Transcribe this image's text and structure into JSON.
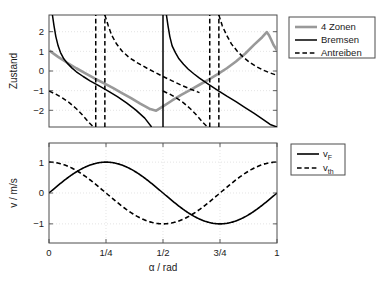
{
  "chart_data": [
    {
      "id": "top",
      "type": "line",
      "title": "",
      "xlabel": "",
      "ylabel": "Zustand",
      "xlim": [
        0,
        1
      ],
      "ylim": [
        -2.85,
        2.85
      ],
      "xticks": [],
      "xticklabels": [],
      "yticks": [
        -2,
        -1,
        0,
        1,
        2
      ],
      "yticklabels": [
        "−2",
        "−1",
        "0",
        "1",
        "2"
      ],
      "grid": true,
      "legend_position": "outside-right-top",
      "legend": [
        {
          "label": "4 Zonen",
          "style": "solid",
          "color": "#999999",
          "width": 2.6
        },
        {
          "label": "Bremsen",
          "style": "solid",
          "color": "#000000",
          "width": 1.5
        },
        {
          "label": "Antreiben",
          "style": "dashed",
          "color": "#000000",
          "width": 1.5
        }
      ],
      "series": [
        {
          "name": "4 Zonen",
          "style": "solid",
          "color": "#999999",
          "width": 2.6,
          "points": [
            [
              0.0,
              1.05
            ],
            [
              0.04,
              0.72
            ],
            [
              0.08,
              0.42
            ],
            [
              0.12,
              0.14
            ],
            [
              0.16,
              -0.12
            ],
            [
              0.2,
              -0.38
            ],
            [
              0.24,
              -0.62
            ],
            [
              0.28,
              -0.86
            ],
            [
              0.32,
              -1.12
            ],
            [
              0.36,
              -1.38
            ],
            [
              0.4,
              -1.66
            ],
            [
              0.44,
              -1.92
            ],
            [
              0.47,
              -2.02
            ],
            [
              0.5,
              -1.8
            ],
            [
              0.54,
              -1.5
            ],
            [
              0.58,
              -1.22
            ],
            [
              0.62,
              -0.96
            ],
            [
              0.66,
              -0.7
            ],
            [
              0.7,
              -0.44
            ],
            [
              0.74,
              -0.16
            ],
            [
              0.78,
              0.14
            ],
            [
              0.82,
              0.48
            ],
            [
              0.86,
              0.88
            ],
            [
              0.9,
              1.34
            ],
            [
              0.935,
              1.72
            ],
            [
              0.955,
              1.98
            ],
            [
              0.965,
              1.82
            ],
            [
              0.975,
              1.58
            ],
            [
              0.985,
              1.32
            ],
            [
              1.0,
              1.05
            ]
          ]
        },
        {
          "name": "Bremsen-a",
          "style": "solid",
          "color": "#000000",
          "width": 1.5,
          "points": [
            [
              0.015,
              2.85
            ],
            [
              0.022,
              2.3
            ],
            [
              0.03,
              1.75
            ],
            [
              0.04,
              1.28
            ],
            [
              0.05,
              0.95
            ],
            [
              0.065,
              0.62
            ],
            [
              0.08,
              0.4
            ],
            [
              0.1,
              0.16
            ],
            [
              0.12,
              -0.04
            ],
            [
              0.15,
              -0.28
            ],
            [
              0.18,
              -0.5
            ],
            [
              0.22,
              -0.76
            ],
            [
              0.26,
              -1.02
            ],
            [
              0.3,
              -1.3
            ],
            [
              0.34,
              -1.62
            ],
            [
              0.38,
              -1.98
            ],
            [
              0.42,
              -2.4
            ],
            [
              0.45,
              -2.85
            ]
          ]
        },
        {
          "name": "Bremsen-b",
          "style": "solid",
          "color": "#000000",
          "width": 1.5,
          "points": [
            [
              0.515,
              2.85
            ],
            [
              0.522,
              2.3
            ],
            [
              0.53,
              1.75
            ],
            [
              0.54,
              1.28
            ],
            [
              0.555,
              0.92
            ],
            [
              0.57,
              0.62
            ],
            [
              0.59,
              0.34
            ],
            [
              0.61,
              0.1
            ],
            [
              0.635,
              -0.14
            ],
            [
              0.66,
              -0.36
            ],
            [
              0.7,
              -0.68
            ],
            [
              0.74,
              -0.98
            ],
            [
              0.78,
              -1.28
            ],
            [
              0.82,
              -1.56
            ],
            [
              0.86,
              -1.86
            ],
            [
              0.9,
              -2.16
            ],
            [
              0.94,
              -2.48
            ],
            [
              0.97,
              -2.72
            ],
            [
              1.0,
              -2.85
            ]
          ]
        },
        {
          "name": "Bremsen-vertical",
          "style": "solid",
          "color": "#000000",
          "width": 1.5,
          "points": [
            [
              0.5,
              -2.85
            ],
            [
              0.5,
              2.85
            ]
          ]
        },
        {
          "name": "Antreiben-a",
          "style": "dashed",
          "color": "#000000",
          "width": 1.5,
          "points": [
            [
              0.0,
              -1.02
            ],
            [
              0.03,
              -1.18
            ],
            [
              0.06,
              -1.38
            ],
            [
              0.09,
              -1.62
            ],
            [
              0.12,
              -1.92
            ],
            [
              0.15,
              -2.28
            ],
            [
              0.175,
              -2.62
            ],
            [
              0.195,
              -2.85
            ]
          ]
        },
        {
          "name": "Antreiben-b",
          "style": "dashed",
          "color": "#000000",
          "width": 1.5,
          "points": [
            [
              0.245,
              2.85
            ],
            [
              0.26,
              2.3
            ],
            [
              0.275,
              1.82
            ],
            [
              0.295,
              1.4
            ],
            [
              0.32,
              1.02
            ],
            [
              0.35,
              0.7
            ],
            [
              0.39,
              0.4
            ],
            [
              0.43,
              0.14
            ],
            [
              0.47,
              -0.1
            ],
            [
              0.5,
              -0.28
            ],
            [
              0.54,
              -0.5
            ],
            [
              0.58,
              -0.72
            ],
            [
              0.62,
              -0.92
            ],
            [
              0.66,
              -1.1
            ]
          ]
        },
        {
          "name": "Antreiben-c",
          "style": "dashed",
          "color": "#000000",
          "width": 1.5,
          "points": [
            [
              0.5,
              -1.02
            ],
            [
              0.53,
              -1.18
            ],
            [
              0.56,
              -1.38
            ],
            [
              0.59,
              -1.62
            ],
            [
              0.62,
              -1.92
            ],
            [
              0.65,
              -2.28
            ],
            [
              0.675,
              -2.62
            ],
            [
              0.695,
              -2.85
            ]
          ]
        },
        {
          "name": "Antreiben-d",
          "style": "dashed",
          "color": "#000000",
          "width": 1.5,
          "points": [
            [
              0.745,
              2.85
            ],
            [
              0.76,
              2.3
            ],
            [
              0.78,
              1.8
            ],
            [
              0.8,
              1.38
            ],
            [
              0.825,
              1.02
            ],
            [
              0.85,
              0.72
            ],
            [
              0.88,
              0.44
            ],
            [
              0.91,
              0.22
            ],
            [
              0.94,
              0.04
            ],
            [
              0.97,
              -0.1
            ],
            [
              1.0,
              -0.22
            ]
          ]
        },
        {
          "name": "Antreiben-vertical-1",
          "style": "dashed",
          "color": "#000000",
          "width": 1.5,
          "points": [
            [
              0.205,
              -2.85
            ],
            [
              0.205,
              2.85
            ]
          ]
        },
        {
          "name": "Antreiben-vertical-2",
          "style": "dashed",
          "color": "#000000",
          "width": 1.5,
          "points": [
            [
              0.245,
              -2.85
            ],
            [
              0.245,
              2.85
            ]
          ]
        },
        {
          "name": "Antreiben-vertical-3",
          "style": "dashed",
          "color": "#000000",
          "width": 1.5,
          "points": [
            [
              0.705,
              -2.85
            ],
            [
              0.705,
              2.85
            ]
          ]
        },
        {
          "name": "Antreiben-vertical-4",
          "style": "dashed",
          "color": "#000000",
          "width": 1.5,
          "points": [
            [
              0.745,
              -2.85
            ],
            [
              0.745,
              2.85
            ]
          ]
        }
      ]
    },
    {
      "id": "bottom",
      "type": "line",
      "title": "",
      "xlabel": "α / rad",
      "ylabel": "v / m/s",
      "xlim": [
        0,
        1
      ],
      "ylim": [
        -1.62,
        1.62
      ],
      "xticks": [
        0,
        0.25,
        0.5,
        0.75,
        1
      ],
      "xticklabels": [
        "0",
        "1/4",
        "1/2",
        "3/4",
        "1"
      ],
      "yticks": [
        -1,
        0,
        1
      ],
      "yticklabels": [
        "−1",
        "0",
        "1"
      ],
      "grid": true,
      "legend_position": "outside-right-top",
      "legend": [
        {
          "label": "v",
          "sublabel": "F",
          "style": "solid",
          "color": "#000000",
          "width": 1.6
        },
        {
          "label": "v",
          "sublabel": "th",
          "style": "dashed",
          "color": "#000000",
          "width": 1.6
        }
      ],
      "series": [
        {
          "name": "v_F",
          "formula": "sin(2*pi*alpha)",
          "style": "solid",
          "color": "#000000",
          "width": 1.6,
          "points": []
        },
        {
          "name": "v_th",
          "formula": "cos(2*pi*alpha)",
          "style": "dashed",
          "color": "#000000",
          "width": 1.6,
          "points": []
        }
      ]
    }
  ],
  "figure": {
    "background": "#ffffff",
    "frame_color": "#4d4d4d",
    "grid_color": "#d9d9d9",
    "accent_gray": "#999999"
  }
}
